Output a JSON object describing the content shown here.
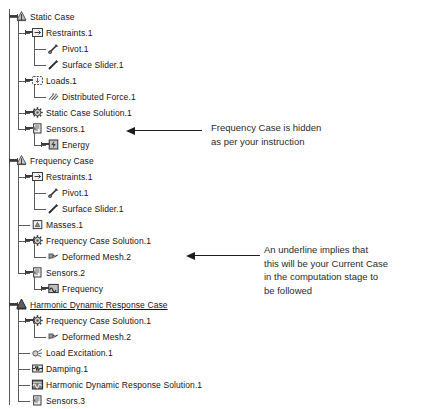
{
  "tree": {
    "name": "analysis-specification-tree",
    "indent_px": 16,
    "row_height": 16,
    "first_row_top": 9,
    "nodes": [
      {
        "label": "Static Case",
        "level": 0,
        "icon": "static-case-icon",
        "expandable": true,
        "expanded": true,
        "underlined": false
      },
      {
        "label": "Restraints.1",
        "level": 1,
        "icon": "restraints-icon",
        "expandable": true,
        "expanded": true,
        "underlined": false
      },
      {
        "label": "Pivot.1",
        "level": 2,
        "icon": "pivot-icon",
        "expandable": false,
        "expanded": false,
        "underlined": false
      },
      {
        "label": "Surface Slider.1",
        "level": 2,
        "icon": "surface-slider-icon",
        "expandable": false,
        "expanded": false,
        "underlined": false,
        "last_child": true
      },
      {
        "label": "Loads.1",
        "level": 1,
        "icon": "loads-icon",
        "expandable": true,
        "expanded": true,
        "underlined": false
      },
      {
        "label": "Distributed Force.1",
        "level": 2,
        "icon": "distributed-force-icon",
        "expandable": false,
        "expanded": false,
        "underlined": false,
        "last_child": true
      },
      {
        "label": "Static Case Solution.1",
        "level": 1,
        "icon": "solution-icon",
        "expandable": true,
        "expanded": false,
        "underlined": false
      },
      {
        "label": "Sensors.1",
        "level": 1,
        "icon": "sensors-icon",
        "expandable": true,
        "expanded": true,
        "underlined": false,
        "last_child": true
      },
      {
        "label": "Energy",
        "level": 2,
        "icon": "energy-sensor-icon",
        "expandable": true,
        "expanded": false,
        "underlined": false,
        "last_child": true
      },
      {
        "label": "Frequency Case",
        "level": 0,
        "icon": "frequency-case-icon",
        "expandable": true,
        "expanded": true,
        "underlined": false
      },
      {
        "label": "Restraints.1",
        "level": 1,
        "icon": "restraints-icon",
        "expandable": true,
        "expanded": true,
        "underlined": false
      },
      {
        "label": "Pivot.1",
        "level": 2,
        "icon": "pivot-icon",
        "expandable": false,
        "expanded": false,
        "underlined": false
      },
      {
        "label": "Surface Slider.1",
        "level": 2,
        "icon": "surface-slider-icon",
        "expandable": false,
        "expanded": false,
        "underlined": false,
        "last_child": true
      },
      {
        "label": "Masses.1",
        "level": 1,
        "icon": "masses-icon",
        "expandable": false,
        "expanded": false,
        "underlined": false
      },
      {
        "label": "Frequency Case Solution.1",
        "level": 1,
        "icon": "solution-icon",
        "expandable": true,
        "expanded": true,
        "underlined": false
      },
      {
        "label": "Deformed Mesh.2",
        "level": 2,
        "icon": "deformed-mesh-icon",
        "expandable": false,
        "expanded": false,
        "underlined": false,
        "last_child": true
      },
      {
        "label": "Sensors.2",
        "level": 1,
        "icon": "sensors-icon",
        "expandable": true,
        "expanded": true,
        "underlined": false,
        "last_child": true
      },
      {
        "label": "Frequency",
        "level": 2,
        "icon": "frequency-sensor-icon",
        "expandable": true,
        "expanded": false,
        "underlined": false,
        "last_child": true
      },
      {
        "label": "Harmonic Dynamic Response Case",
        "level": 0,
        "icon": "harmonic-case-icon",
        "expandable": true,
        "expanded": true,
        "underlined": true
      },
      {
        "label": "Frequency Case Solution.1",
        "level": 1,
        "icon": "solution-icon",
        "expandable": true,
        "expanded": true,
        "underlined": false
      },
      {
        "label": "Deformed Mesh.2",
        "level": 2,
        "icon": "deformed-mesh-icon",
        "expandable": false,
        "expanded": false,
        "underlined": false,
        "last_child": true
      },
      {
        "label": "Load Excitation.1",
        "level": 1,
        "icon": "load-excitation-icon",
        "expandable": false,
        "expanded": false,
        "underlined": false
      },
      {
        "label": "Damping.1",
        "level": 1,
        "icon": "damping-icon",
        "expandable": false,
        "expanded": false,
        "underlined": false
      },
      {
        "label": "Harmonic Dynamic Response Solution.1",
        "level": 1,
        "icon": "harmonic-solution-icon",
        "expandable": false,
        "expanded": false,
        "underlined": false
      },
      {
        "label": "Sensors.3",
        "level": 1,
        "icon": "sensors-icon",
        "expandable": false,
        "expanded": false,
        "underlined": false,
        "last_child": true
      }
    ]
  },
  "annotations": [
    {
      "id": "frequency-case-hidden-note",
      "text": "Frequency Case is hidden\nas per your instruction",
      "arrow_points_to": "Frequency Case"
    },
    {
      "id": "current-case-underline-note",
      "text": "An underline implies that\nthis will be your Current Case\nin the computation stage to\nbe followed",
      "arrow_points_to": "Harmonic Dynamic Response Case"
    }
  ],
  "colors": {
    "background": "#ffffff",
    "text": "#141414",
    "connector": "#5a5a5a",
    "arrow": "#1d1d1d"
  }
}
